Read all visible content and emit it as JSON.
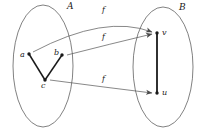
{
  "figure": {
    "background_color": "#ffffff",
    "stroke_color": "#3a3a3a",
    "vertex_color": "#1a1a1a",
    "edge_color": "#1a1a1a",
    "arrow_color": "#555555"
  },
  "sets": {
    "domain": {
      "label": "A",
      "label_x": 67,
      "label_y": 2,
      "cx": 43,
      "cy": 66,
      "rx": 30,
      "ry": 61
    },
    "codomain": {
      "label": "B",
      "label_x": 179,
      "label_y": 3,
      "cx": 163,
      "cy": 67,
      "rx": 30,
      "ry": 60
    }
  },
  "vertices": {
    "domain": [
      {
        "id": "a",
        "label": "a",
        "x": 29,
        "y": 54,
        "label_x": 20,
        "label_y": 51
      },
      {
        "id": "b",
        "label": "b",
        "x": 62,
        "y": 55,
        "label_x": 54,
        "label_y": 49
      },
      {
        "id": "c",
        "label": "c",
        "x": 45,
        "y": 80,
        "label_x": 41,
        "label_y": 82
      }
    ],
    "codomain": [
      {
        "id": "v",
        "label": "v",
        "x": 157,
        "y": 33,
        "label_x": 162,
        "label_y": 29
      },
      {
        "id": "u",
        "label": "u",
        "x": 157,
        "y": 93,
        "label_x": 162,
        "label_y": 89
      }
    ]
  },
  "edges": {
    "domain": [
      {
        "from": "a",
        "to": "c"
      },
      {
        "from": "b",
        "to": "c"
      }
    ],
    "codomain": [
      {
        "from": "v",
        "to": "u"
      }
    ]
  },
  "mappings": [
    {
      "id": "f-a-v",
      "label": "f",
      "from": "a",
      "to": "v",
      "label_x": 102,
      "label_y": 6,
      "x1": 33,
      "y1": 52,
      "cx": 105,
      "cy": 14,
      "x2": 152,
      "y2": 32
    },
    {
      "id": "f-b-v",
      "label": "f",
      "from": "b",
      "to": "v",
      "label_x": 102,
      "label_y": 33,
      "x1": 67,
      "y1": 55,
      "cx": 110,
      "cy": 44,
      "x2": 152,
      "y2": 34
    },
    {
      "id": "f-c-u",
      "label": "f",
      "from": "c",
      "to": "u",
      "label_x": 102,
      "label_y": 75,
      "x1": 50,
      "y1": 80,
      "cx": 103,
      "cy": 87,
      "x2": 152,
      "y2": 93
    }
  ]
}
